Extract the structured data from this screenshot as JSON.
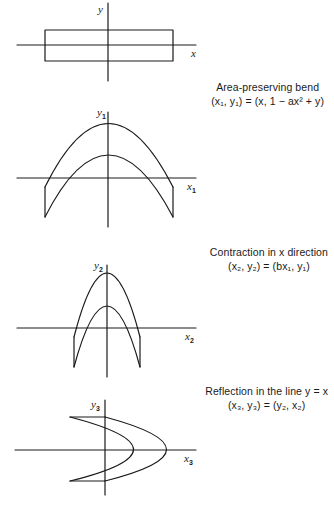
{
  "figure": {
    "panels": [
      {
        "id": "original",
        "axis_x_label": "x",
        "axis_y_label": "y",
        "axis_x_sub": "",
        "axis_y_sub": "",
        "shape": "rectangle"
      },
      {
        "id": "bend",
        "axis_x_label": "x",
        "axis_y_label": "y",
        "axis_x_sub": "1",
        "axis_y_sub": "1",
        "shape": "bent-arch",
        "caption_title": "Area-preserving bend",
        "caption_formula": "(x₁, y₁) = (x, 1 − ax² + y)"
      },
      {
        "id": "contraction",
        "axis_x_label": "x",
        "axis_y_label": "y",
        "axis_x_sub": "2",
        "axis_y_sub": "2",
        "shape": "narrow-arch",
        "caption_title": "Contraction in x direction",
        "caption_formula": "(x₂, y₂) = (bx₁, y₁)"
      },
      {
        "id": "reflection",
        "axis_x_label": "x",
        "axis_y_label": "y",
        "axis_x_sub": "3",
        "axis_y_sub": "3",
        "shape": "sideways-horseshoe",
        "caption_title": "Reflection in the line y = x",
        "caption_formula": "(x₃, y₃) = (y₂, x₂)"
      }
    ],
    "line_color": "#1a1a1a",
    "background": "#ffffff"
  }
}
